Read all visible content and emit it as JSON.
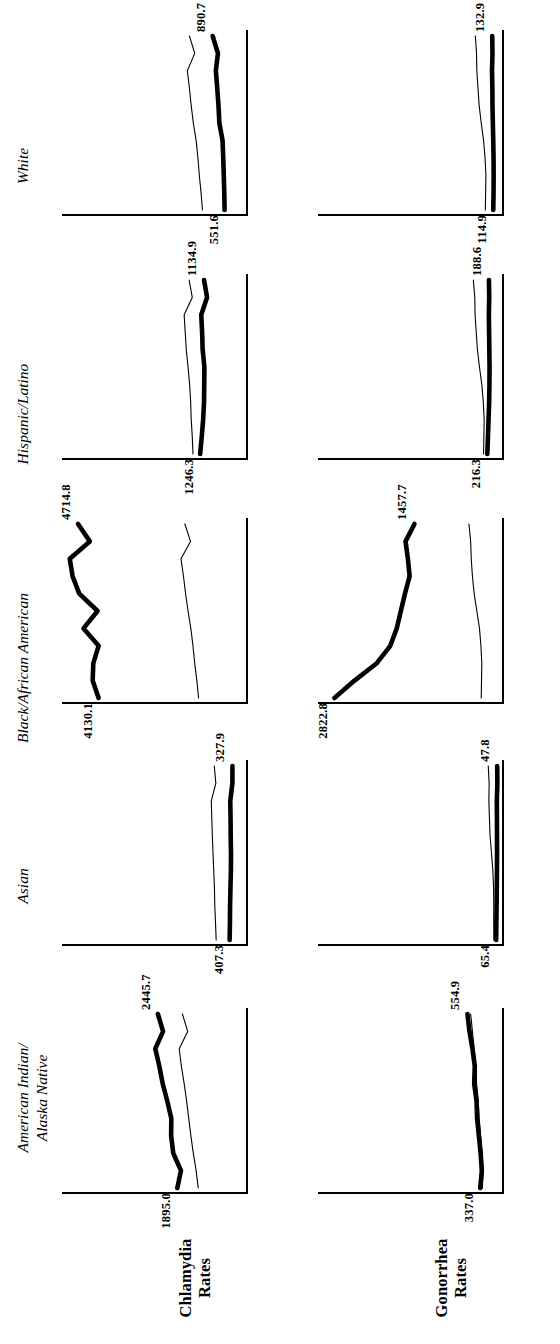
{
  "figure": {
    "orientation": "rotated-90-ccw",
    "row_labels": [
      {
        "id": "chlamydia",
        "line1": "Chlamydia",
        "line2": "Rates"
      },
      {
        "id": "gonorrhea",
        "line1": "Gonorrhea",
        "line2": "Rates"
      }
    ],
    "column_titles": [
      {
        "id": "aian",
        "line1": "American Indian/",
        "line2": "Alaska Native"
      },
      {
        "id": "asian",
        "line1": "Asian",
        "line2": ""
      },
      {
        "id": "black",
        "line1": "Black/African American",
        "line2": ""
      },
      {
        "id": "hispanic",
        "line1": "Hispanic/Latino",
        "line2": ""
      },
      {
        "id": "white",
        "line1": "White",
        "line2": ""
      }
    ]
  },
  "chart_data": {
    "type": "line",
    "title": "",
    "subtitle": "",
    "xlabel": "",
    "ylabel": "Rate per 100,000 population",
    "grid": false,
    "legend": {
      "position": "none",
      "entries": [
        {
          "name": "Race/ethnicity group rate",
          "style": "thick"
        },
        {
          "name": "Reference (overall) rate",
          "style": "thin"
        }
      ]
    },
    "x": [
      2011,
      2012,
      2013,
      2014,
      2015,
      2016,
      2017,
      2018,
      2019,
      2020,
      2021
    ],
    "panels": [
      {
        "row": "Chlamydia Rates",
        "column": "American Indian/Alaska Native",
        "ylim": [
          0,
          5000
        ],
        "start_label": "1895.0",
        "end_label": "2445.7",
        "series": [
          {
            "name": "American Indian/Alaska Native",
            "style": "thick",
            "values": [
              1895.0,
              1790.0,
              2010.0,
              2070.0,
              2065.0,
              2180.0,
              2310.0,
              2405.0,
              2520.0,
              2300.0,
              2445.7
            ]
          },
          {
            "name": "Reference",
            "style": "thin",
            "values": [
              1300.0,
              1360.0,
              1440.0,
              1510.0,
              1570.0,
              1630.0,
              1700.0,
              1780.0,
              1840.0,
              1600.0,
              1750.0
            ]
          }
        ]
      },
      {
        "row": "Chlamydia Rates",
        "column": "Asian",
        "ylim": [
          0,
          5000
        ],
        "start_label": "407.3",
        "end_label": "327.9",
        "series": [
          {
            "name": "Asian",
            "style": "thick",
            "values": [
              407.3,
              400.0,
              395.0,
              385.0,
              372.0,
              370.0,
              378.0,
              382.0,
              390.0,
              330.0,
              327.9
            ]
          },
          {
            "name": "Reference",
            "style": "thin",
            "values": [
              790.0,
              810.0,
              830.0,
              840.0,
              860.0,
              880.0,
              900.0,
              915.0,
              930.0,
              800.0,
              845.0
            ]
          }
        ]
      },
      {
        "row": "Chlamydia Rates",
        "column": "Black/African American",
        "ylim": [
          0,
          5000
        ],
        "start_label": "4130.1",
        "end_label": "4714.8",
        "series": [
          {
            "name": "Black/African American",
            "style": "thick",
            "values": [
              4130.1,
              4300.0,
              4280.0,
              4130.0,
              4560.0,
              4160.0,
              4680.0,
              4870.0,
              4950.0,
              4380.0,
              4714.8
            ]
          },
          {
            "name": "Reference",
            "style": "thin",
            "values": [
              1290.0,
              1340.0,
              1400.0,
              1450.0,
              1510.0,
              1590.0,
              1660.0,
              1720.0,
              1790.0,
              1520.0,
              1680.0
            ]
          }
        ]
      },
      {
        "row": "Chlamydia Rates",
        "column": "Hispanic/Latino",
        "ylim": [
          0,
          5000
        ],
        "start_label": "1246.3",
        "end_label": "1134.9",
        "series": [
          {
            "name": "Hispanic/Latino",
            "style": "thick",
            "values": [
              1246.3,
              1200.0,
              1160.0,
              1135.0,
              1130.0,
              1125.0,
              1175.0,
              1190.0,
              1215.0,
              1050.0,
              1134.9
            ]
          },
          {
            "name": "Reference",
            "style": "thin",
            "values": [
              1450.0,
              1470.0,
              1500.0,
              1515.0,
              1545.0,
              1590.0,
              1640.0,
              1670.0,
              1700.0,
              1470.0,
              1560.0
            ]
          }
        ]
      },
      {
        "row": "Chlamydia Rates",
        "column": "White",
        "ylim": [
          0,
          5000
        ],
        "start_label": "551.6",
        "end_label": "890.7",
        "series": [
          {
            "name": "White",
            "style": "thick",
            "values": [
              551.6,
              560.0,
              575.0,
              590.0,
              610.0,
              700.0,
              725.0,
              760.0,
              800.0,
              740.0,
              890.7
            ]
          },
          {
            "name": "Reference",
            "style": "thin",
            "values": [
              1180.0,
              1220.0,
              1270.0,
              1310.0,
              1360.0,
              1440.0,
              1500.0,
              1550.0,
              1610.0,
              1400.0,
              1550.0
            ]
          }
        ]
      },
      {
        "row": "Gonorrhea Rates",
        "column": "American Indian/Alaska Native",
        "ylim": [
          0,
          3000
        ],
        "start_label": "337.0",
        "end_label": "554.9",
        "series": [
          {
            "name": "American Indian/Alaska Native",
            "style": "thick",
            "values": [
              337.0,
              310.0,
              330.0,
              360.0,
              390.0,
              400.0,
              440.0,
              430.0,
              470.0,
              520.0,
              554.9
            ]
          },
          {
            "name": "Reference",
            "style": "thin",
            "values": [
              300.0,
              290.0,
              305.0,
              330.0,
              355.0,
              370.0,
              400.0,
              405.0,
              440.0,
              470.0,
              500.0
            ]
          }
        ]
      },
      {
        "row": "Gonorrhea Rates",
        "column": "Asian",
        "ylim": [
          0,
          3000
        ],
        "start_label": "65.4",
        "end_label": "47.8",
        "series": [
          {
            "name": "Asian",
            "style": "thick",
            "values": [
              65.4,
              62.0,
              58.0,
              55.0,
              52.0,
              50.0,
              51.0,
              52.0,
              54.0,
              45.0,
              47.8
            ]
          },
          {
            "name": "Reference",
            "style": "thin",
            "values": [
              105.0,
              107.0,
              106.0,
              110.0,
              122.0,
              145.0,
              170.0,
              180.0,
              190.0,
              185.0,
              200.0
            ]
          }
        ]
      },
      {
        "row": "Gonorrhea Rates",
        "column": "Black/African American",
        "ylim": [
          0,
          3000
        ],
        "start_label": "2822.8",
        "end_label": "1457.7",
        "series": [
          {
            "name": "Black/African American",
            "style": "thick",
            "values": [
              2822.8,
              2480.0,
              2100.0,
              1870.0,
              1760.0,
              1690.0,
              1620.0,
              1540.0,
              1570.0,
              1610.0,
              1457.7
            ]
          },
          {
            "name": "Reference",
            "style": "thin",
            "values": [
              320.0,
              315.0,
              310.0,
              325.0,
              350.0,
              395.0,
              440.0,
              470.0,
              490.0,
              500.0,
              530.0
            ]
          }
        ]
      },
      {
        "row": "Gonorrhea Rates",
        "column": "Hispanic/Latino",
        "ylim": [
          0,
          3000
        ],
        "start_label": "216.3",
        "end_label": "188.6",
        "series": [
          {
            "name": "Hispanic/Latino",
            "style": "thick",
            "values": [
              216.3,
              205.0,
              195.0,
              185.0,
              180.0,
              178.0,
              182.0,
              186.0,
              190.0,
              184.0,
              188.6
            ]
          },
          {
            "name": "Reference",
            "style": "thin",
            "values": [
              280.0,
              275.0,
              270.0,
              285.0,
              310.0,
              350.0,
              385.0,
              405.0,
              425.0,
              430.0,
              455.0
            ]
          }
        ]
      },
      {
        "row": "Gonorrhea Rates",
        "column": "White",
        "ylim": [
          0,
          3000
        ],
        "start_label": "114.9",
        "end_label": "132.9",
        "series": [
          {
            "name": "White",
            "style": "thick",
            "values": [
              114.9,
              110.0,
              108.0,
              110.0,
              115.0,
              122.0,
              128.0,
              130.0,
              136.0,
              128.0,
              132.9
            ]
          },
          {
            "name": "Reference",
            "style": "thin",
            "values": [
              250.0,
              245.0,
              240.0,
              255.0,
              280.0,
              320.0,
              355.0,
              375.0,
              395.0,
              400.0,
              420.0
            ]
          }
        ]
      }
    ]
  }
}
